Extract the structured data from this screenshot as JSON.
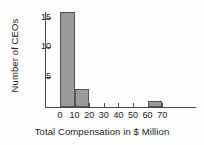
{
  "chart_data": {
    "type": "bar",
    "title": "",
    "subtitle": "",
    "xlabel": "Total Compensation in $ Million",
    "ylabel": "Number of CEOs",
    "grid": false,
    "legend": null,
    "bin_width": 10,
    "xlim": [
      0,
      75
    ],
    "ylim": [
      0,
      17
    ],
    "xticks": [
      0,
      10,
      20,
      30,
      40,
      50,
      60,
      70
    ],
    "yticks": [
      5,
      10,
      15
    ],
    "categories": [
      "0-10",
      "10-20",
      "20-30",
      "30-40",
      "40-50",
      "50-60",
      "60-70"
    ],
    "bins": [
      {
        "start": 0,
        "end": 10,
        "value": 16
      },
      {
        "start": 10,
        "end": 20,
        "value": 3
      },
      {
        "start": 20,
        "end": 30,
        "value": 0
      },
      {
        "start": 30,
        "end": 40,
        "value": 0
      },
      {
        "start": 40,
        "end": 50,
        "value": 0
      },
      {
        "start": 50,
        "end": 60,
        "value": 0
      },
      {
        "start": 60,
        "end": 70,
        "value": 1
      }
    ],
    "values": [
      16,
      3,
      0,
      0,
      0,
      0,
      1
    ],
    "colors": {
      "bar_fill": "#9a9a9a",
      "bar_border": "#555555",
      "axis": "#4a4a4a",
      "text": "#1c1c1c",
      "background": "#fdfdfd"
    }
  }
}
